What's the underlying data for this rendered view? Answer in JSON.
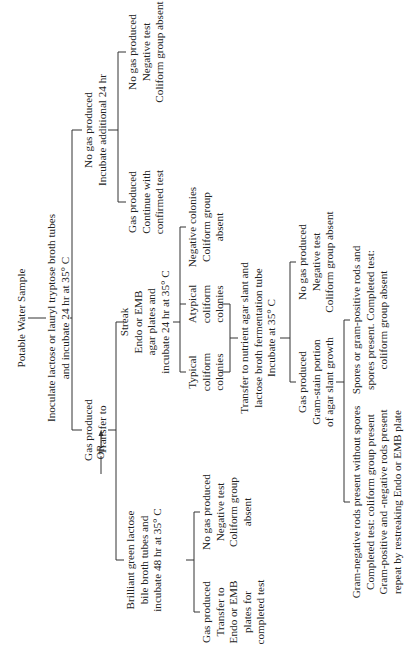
{
  "diagram": {
    "title": "Potable Water Sample",
    "presumptive": {
      "step": [
        "Inoculate lactose or lauryl tryptose broth tubes",
        "and incubate 24 hr at 35° C"
      ],
      "gas": [
        "Gas produced",
        "Transfer to"
      ],
      "no_gas": [
        "No gas produced",
        "Incubate additional 24 hr"
      ],
      "no_gas_then_gas": [
        "Gas produced",
        "Continue with",
        "confirmed test"
      ],
      "no_gas_then_no_gas": [
        "No gas produced",
        "Negative test",
        "Coliform group absent"
      ]
    },
    "confirmed": {
      "or_label": "OR",
      "bgb": [
        "Brilliant green lactose",
        "bile broth tubes and",
        "incubate 48 hr at 35° C"
      ],
      "bgb_gas": [
        "Gas produced",
        "Transfer to",
        "Endo or EMB",
        "plates for",
        "completed test"
      ],
      "bgb_no_gas": [
        "No gas produced",
        "Negative test",
        "Coliform group",
        "absent"
      ],
      "streak": [
        "Streak",
        "Endo or EMB",
        "agar plates and",
        "incubate 24 hr at 35° C"
      ],
      "typical": [
        "Typical",
        "coliform",
        "colonies"
      ],
      "atypical": [
        "Atypical",
        "coliform",
        "colonies"
      ],
      "negative": [
        "Negative colonies",
        "Coliform group",
        "absent"
      ]
    },
    "completed": {
      "transfer": [
        "Transfer to nutrient agar slant and",
        "lactose broth fermentation tube",
        "Incubate at 35° C"
      ],
      "gas": [
        "Gas produced",
        "Gram-stain portion",
        "of agar slant growth"
      ],
      "no_gas": [
        "No gas produced",
        "Negative test",
        "Coliform group absent"
      ],
      "gram_neg": [
        "Gram-negative rods present without spores",
        "Completed test: coliform group present",
        "Gram-positive and -negative rods present",
        "repeat by restreaking Endo or EMB plate"
      ],
      "spores": [
        "Spores or gram-positive rods and",
        "spores present. Completed test:",
        "coliform group absent"
      ]
    }
  }
}
